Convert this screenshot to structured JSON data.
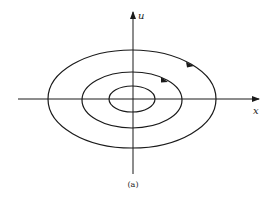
{
  "figure": {
    "caption": "(a)",
    "axes": {
      "x_label": "x",
      "y_label": "u"
    },
    "orbits": [
      {
        "name": "inner",
        "rx": 23,
        "ry": 13
      },
      {
        "name": "middle",
        "rx": 50,
        "ry": 28,
        "arrow": true
      },
      {
        "name": "outer",
        "rx": 84,
        "ry": 49,
        "arrow": true
      }
    ],
    "colors": {
      "line": "#1a1a1a",
      "background": "#ffffff"
    }
  }
}
